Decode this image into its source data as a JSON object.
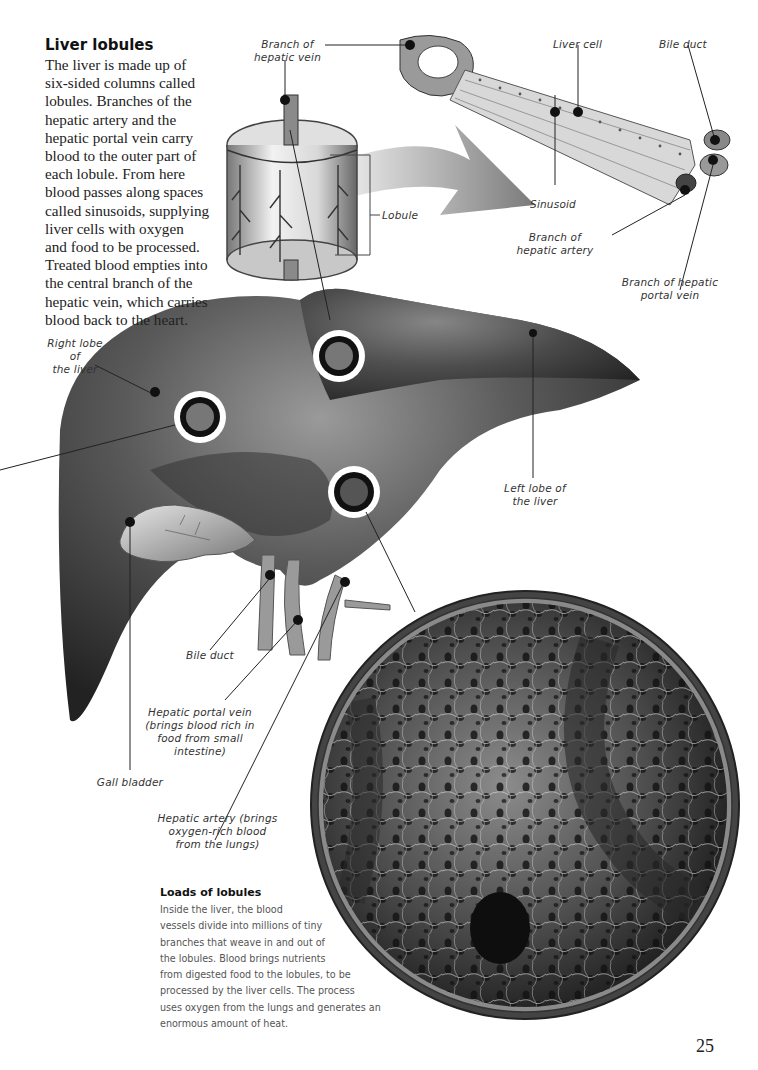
{
  "intro": {
    "title": "Liver lobules",
    "lines": [
      "The liver is made up of",
      "six-sided columns called",
      "lobules. Branches of the",
      "hepatic artery and the",
      "hepatic portal vein carry",
      "blood to the outer part of",
      "each lobule. From here",
      "blood passes along spaces",
      "called sinusoids, supplying",
      "liver cells with oxygen",
      "and food to be processed.",
      "Treated blood empties into",
      "the central branch of the",
      "hepatic vein, which carries",
      "blood back to the heart."
    ]
  },
  "labels": {
    "branch_hepatic_vein": [
      "Branch of",
      "hepatic vein"
    ],
    "liver_cell": "Liver cell",
    "bile_duct_top": "Bile duct",
    "lobule": "Lobule",
    "sinusoid": "Sinusoid",
    "branch_hepatic_artery": [
      "Branch of",
      "hepatic artery"
    ],
    "branch_hepatic_portal_vein": [
      "Branch of hepatic",
      "portal vein"
    ],
    "right_lobe": [
      "Right lobe",
      "of",
      "the liver"
    ],
    "left_lobe": [
      "Left lobe of",
      "the liver"
    ],
    "bile_duct": "Bile duct",
    "hepatic_portal_vein": [
      "Hepatic portal vein",
      "(brings blood rich in",
      "food from small",
      "intestine)"
    ],
    "gall_bladder": "Gall bladder",
    "hepatic_artery": [
      "Hepatic artery (brings",
      "oxygen-rich blood",
      "from the lungs)"
    ]
  },
  "loads": {
    "title": "Loads of lobules",
    "lines": [
      "Inside the liver, the blood",
      "vessels divide into millions of tiny",
      "branches that weave in and out of",
      "the lobules. Blood brings nutrients",
      "from digested food to the lobules, to be",
      "processed by the liver cells. The process",
      "uses oxygen from the lungs and generates an",
      "enormous amount of heat."
    ]
  },
  "page_number": "25",
  "colors": {
    "liver_dark": "#2e2e2e",
    "liver_mid": "#5a5a5a",
    "liver_light": "#9a9a9a",
    "leader_line": "#222222"
  }
}
